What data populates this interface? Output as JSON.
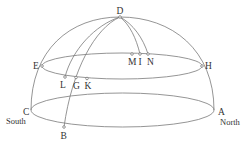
{
  "diagram": {
    "points": [
      {
        "id": "D",
        "label": "D"
      },
      {
        "id": "E",
        "label": "E"
      },
      {
        "id": "H",
        "label": "H"
      },
      {
        "id": "C",
        "label": "C"
      },
      {
        "id": "A",
        "label": "A"
      },
      {
        "id": "B",
        "label": "B"
      },
      {
        "id": "L",
        "label": "L"
      },
      {
        "id": "G",
        "label": "G"
      },
      {
        "id": "K",
        "label": "K"
      },
      {
        "id": "M",
        "label": "M"
      },
      {
        "id": "I",
        "label": "I"
      },
      {
        "id": "N",
        "label": "N"
      }
    ],
    "directions": {
      "south": "South",
      "north": "North"
    }
  }
}
